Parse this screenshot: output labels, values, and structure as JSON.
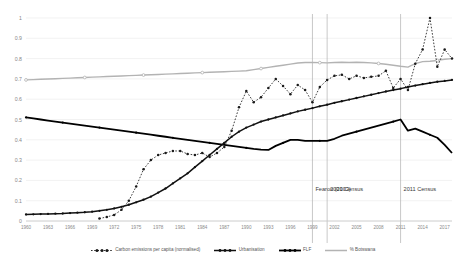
{
  "chart_data": {
    "type": "line",
    "title": "",
    "xlabel": "",
    "ylabel": "",
    "ylim": [
      0,
      1
    ],
    "yticks": [
      "0",
      "0.1",
      "0.2",
      "0.3",
      "0.4",
      "0.5",
      "0.6",
      "0.7",
      "0.8",
      "0.9",
      "1"
    ],
    "grid": true,
    "legend_position": "bottom",
    "xlim": [
      1960,
      2018
    ],
    "x_tick_labels": [
      "1960",
      "1963",
      "1966",
      "1969",
      "1972",
      "1975",
      "1978",
      "1981",
      "1984",
      "1987",
      "1990",
      "1993",
      "1996",
      "1999",
      "2002",
      "2005",
      "2008",
      "2011",
      "2014",
      "2017"
    ],
    "x": [
      1960,
      1961,
      1962,
      1963,
      1964,
      1965,
      1966,
      1967,
      1968,
      1969,
      1970,
      1971,
      1972,
      1973,
      1974,
      1975,
      1976,
      1977,
      1978,
      1979,
      1980,
      1981,
      1982,
      1983,
      1984,
      1985,
      1986,
      1987,
      1988,
      1989,
      1990,
      1991,
      1992,
      1993,
      1994,
      1995,
      1996,
      1997,
      1998,
      1999,
      2000,
      2001,
      2002,
      2003,
      2004,
      2005,
      2006,
      2007,
      2008,
      2009,
      2010,
      2011,
      2012,
      2013,
      2014,
      2015,
      2016,
      2017,
      2018
    ],
    "series": [
      {
        "name": "Carbon emissions per capita (normalised)",
        "style": "dotted-marker",
        "color": "#1a1a1a",
        "values": [
          null,
          null,
          null,
          null,
          null,
          null,
          null,
          null,
          null,
          null,
          0.012,
          0.02,
          0.03,
          0.055,
          0.1,
          0.17,
          0.255,
          0.3,
          0.325,
          0.335,
          0.345,
          0.345,
          0.33,
          0.325,
          0.335,
          0.315,
          0.335,
          0.365,
          0.445,
          0.56,
          0.64,
          0.585,
          0.61,
          0.655,
          0.7,
          0.665,
          0.625,
          0.67,
          0.645,
          0.585,
          0.66,
          0.695,
          0.715,
          0.72,
          0.7,
          0.715,
          0.705,
          0.71,
          0.715,
          0.74,
          0.655,
          0.7,
          0.645,
          0.775,
          0.845,
          1.0,
          0.76,
          0.845,
          0.8
        ]
      },
      {
        "name": "Urbanisation",
        "style": "solid-marker",
        "color": "#111111",
        "values": [
          0.032,
          0.033,
          0.034,
          0.035,
          0.036,
          0.037,
          0.039,
          0.041,
          0.043,
          0.046,
          0.05,
          0.055,
          0.062,
          0.07,
          0.08,
          0.092,
          0.105,
          0.12,
          0.14,
          0.16,
          0.185,
          0.21,
          0.235,
          0.265,
          0.295,
          0.325,
          0.355,
          0.385,
          0.415,
          0.44,
          0.46,
          0.475,
          0.49,
          0.5,
          0.51,
          0.52,
          0.53,
          0.54,
          0.548,
          0.556,
          0.565,
          0.573,
          0.582,
          0.59,
          0.598,
          0.606,
          0.614,
          0.622,
          0.63,
          0.638,
          0.645,
          0.652,
          0.66,
          0.667,
          0.674,
          0.68,
          0.686,
          0.69,
          0.695
        ]
      },
      {
        "name": "FLF",
        "style": "solid-thick",
        "color": "#000000",
        "values": [
          0.51,
          0.505,
          0.5,
          0.495,
          0.49,
          0.485,
          0.48,
          0.475,
          0.47,
          0.465,
          0.46,
          0.455,
          0.45,
          0.445,
          0.44,
          0.435,
          0.43,
          0.425,
          0.42,
          0.415,
          0.41,
          0.405,
          0.4,
          0.395,
          0.39,
          0.385,
          0.38,
          0.375,
          0.37,
          0.365,
          0.36,
          0.355,
          0.352,
          0.35,
          0.37,
          0.385,
          0.4,
          0.4,
          0.395,
          0.395,
          0.395,
          0.395,
          0.405,
          0.42,
          0.43,
          0.44,
          0.45,
          0.46,
          0.47,
          0.48,
          0.49,
          0.5,
          0.445,
          0.455,
          0.44,
          0.425,
          0.41,
          0.375,
          0.335
        ]
      },
      {
        "name": "% Botswana",
        "style": "solid-gray",
        "color": "#b3b3b3",
        "values": [
          0.695,
          0.6965,
          0.698,
          0.6995,
          0.701,
          0.7025,
          0.704,
          0.7055,
          0.707,
          0.7085,
          0.71,
          0.7115,
          0.713,
          0.7145,
          0.716,
          0.7175,
          0.719,
          0.7205,
          0.722,
          0.7235,
          0.725,
          0.7265,
          0.728,
          0.7295,
          0.731,
          0.7325,
          0.734,
          0.7355,
          0.737,
          0.7385,
          0.74,
          0.7455,
          0.751,
          0.7565,
          0.762,
          0.7675,
          0.773,
          0.7785,
          0.781,
          0.7805,
          0.78,
          0.779,
          0.781,
          0.782,
          0.781,
          0.782,
          0.781,
          0.779,
          0.776,
          0.772,
          0.767,
          0.762,
          0.758,
          0.775,
          0.785,
          0.787,
          0.791,
          0.797,
          0.8
        ]
      }
    ],
    "annotations": [
      {
        "label": "Fearon (2003)",
        "x": 1999
      },
      {
        "label": "2001 Census",
        "x": 2001
      },
      {
        "label": "2011 Census",
        "x": 2011
      }
    ]
  },
  "legend": {
    "items": [
      {
        "label": "Carbon emissions per capita (normalised)",
        "marker": "dotted-marker-icon"
      },
      {
        "label": "Urbanisation",
        "marker": "solid-marker-icon"
      },
      {
        "label": "FLF",
        "marker": "solid-thick-icon"
      },
      {
        "label": "% Botswana",
        "marker": "solid-gray-icon"
      }
    ]
  },
  "colors": {
    "grid": "#ececec",
    "axis": "#d0d0d0",
    "annotation_line": "#b0b0b0",
    "carbon": "#1a1a1a",
    "urbanisation": "#111111",
    "flf": "#000000",
    "botswana": "#b3b3b3"
  }
}
